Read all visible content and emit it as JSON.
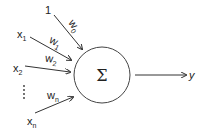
{
  "diagram": {
    "node": {
      "symbol": "Σ"
    },
    "inputs": [
      {
        "label": "1",
        "sub": "",
        "weight": "w",
        "weight_sub": "0"
      },
      {
        "label": "x",
        "sub": "1",
        "weight": "w",
        "weight_sub": "1"
      },
      {
        "label": "x",
        "sub": "2",
        "weight": "w",
        "weight_sub": "2"
      },
      {
        "label": "x",
        "sub": "n",
        "weight": "w",
        "weight_sub": "n"
      }
    ],
    "ellipsis": "⋮",
    "output": {
      "label": "y"
    }
  }
}
